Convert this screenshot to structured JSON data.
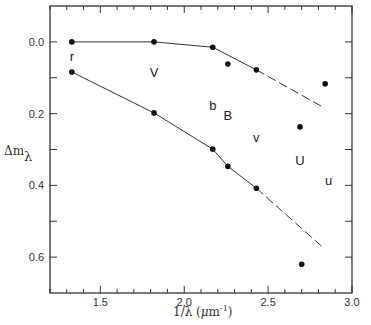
{
  "chart_data": {
    "type": "line",
    "title": "",
    "xlabel": "1/λ (μm⁻¹)",
    "ylabel": "Δm_λ",
    "xlim": [
      1.2,
      3.0
    ],
    "ylim": [
      0.7,
      -0.1
    ],
    "y_inverted": true,
    "grid": false,
    "x_ticks": [
      "1.5",
      "2.0",
      "2.5",
      "3.0"
    ],
    "x_tick_values": [
      1.5,
      2.0,
      2.5,
      3.0
    ],
    "y_ticks": [
      "0.0",
      "0.2",
      "0.4",
      "0.6"
    ],
    "y_tick_values": [
      0.0,
      0.2,
      0.4,
      0.6
    ],
    "series": [
      {
        "name": "upper",
        "x": [
          1.33,
          1.82,
          2.17,
          2.43
        ],
        "y": [
          0.0,
          0.0,
          0.015,
          0.078
        ],
        "extrapolation": {
          "x": [
            2.43,
            2.82
          ],
          "y": [
            0.078,
            0.18
          ],
          "style": "dashed"
        }
      },
      {
        "name": "lower",
        "x": [
          1.33,
          1.82,
          2.17,
          2.26,
          2.43
        ],
        "y": [
          0.084,
          0.198,
          0.299,
          0.347,
          0.408
        ],
        "extrapolation": {
          "x": [
            2.43,
            2.82
          ],
          "y": [
            0.408,
            0.57
          ],
          "style": "dashed"
        }
      }
    ],
    "extra_points": [
      {
        "x": 2.26,
        "y": 0.062
      },
      {
        "x": 2.84,
        "y": 0.117
      },
      {
        "x": 2.69,
        "y": 0.237
      },
      {
        "x": 2.7,
        "y": 0.62
      }
    ],
    "annotations": [
      {
        "text": "r",
        "x": 1.33,
        "y": 0.04
      },
      {
        "text": "V",
        "x": 1.82,
        "y": 0.085
      },
      {
        "text": "b",
        "x": 2.17,
        "y": 0.175
      },
      {
        "text": "B",
        "x": 2.26,
        "y": 0.205
      },
      {
        "text": "v",
        "x": 2.43,
        "y": 0.265
      },
      {
        "text": "U",
        "x": 2.69,
        "y": 0.33
      },
      {
        "text": "u",
        "x": 2.86,
        "y": 0.385
      }
    ]
  },
  "labels": {
    "xlabel_main": "1/λ (",
    "xlabel_mu": "μ",
    "xlabel_unit": "m",
    "xlabel_exp": "-1",
    "xlabel_close": ")",
    "ylabel_delta": "Δm",
    "ylabel_sub": "λ"
  }
}
